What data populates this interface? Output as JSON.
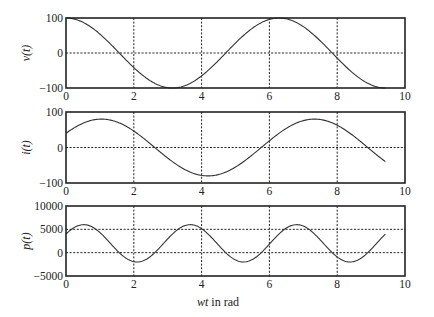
{
  "chart_data": [
    {
      "type": "line",
      "title": "",
      "xlabel": "",
      "ylabel": "v(t)",
      "xlim": [
        0,
        10
      ],
      "ylim": [
        -100,
        100
      ],
      "xticks": [
        0,
        2,
        4,
        6,
        8,
        10
      ],
      "yticks": [
        -100,
        0,
        100
      ],
      "ytick_labels": [
        "−100",
        "0",
        "100"
      ],
      "grid": true,
      "formula": "100*cos(t)",
      "series": [
        {
          "name": "v(t)",
          "x": [
            0,
            0.5,
            1.0,
            1.5,
            2.0,
            2.5,
            3.0,
            3.5,
            4.0,
            4.5,
            5.0,
            5.5,
            6.0,
            6.5,
            7.0,
            7.5,
            8.0,
            8.5,
            9.0,
            9.42
          ],
          "y": [
            100,
            88,
            54,
            7,
            -42,
            -80,
            -99,
            -94,
            -65,
            -21,
            28,
            71,
            96,
            98,
            75,
            35,
            -15,
            -60,
            -91,
            -100
          ]
        }
      ]
    },
    {
      "type": "line",
      "title": "",
      "xlabel": "",
      "ylabel": "i(t)",
      "xlim": [
        0,
        10
      ],
      "ylim": [
        -100,
        100
      ],
      "xticks": [
        0,
        2,
        4,
        6,
        8,
        10
      ],
      "yticks": [
        -100,
        0,
        100
      ],
      "ytick_labels": [
        "−100",
        "0",
        "100"
      ],
      "grid": true,
      "formula": "80*cos(t - pi/3)",
      "series": [
        {
          "name": "i(t)",
          "x": [
            0,
            0.5,
            1.0,
            1.5,
            2.0,
            2.5,
            3.0,
            3.5,
            4.0,
            4.5,
            5.0,
            5.5,
            6.0,
            6.5,
            7.0,
            7.5,
            8.0,
            8.5,
            9.0,
            9.42
          ],
          "y": [
            40,
            69,
            80,
            71,
            44,
            6,
            -35,
            -66,
            -80,
            -75,
            -51,
            -14,
            28,
            62,
            79,
            77,
            55,
            19,
            -23,
            -40
          ]
        }
      ]
    },
    {
      "type": "line",
      "title": "",
      "xlabel": "wt in rad",
      "ylabel": "p(t)",
      "xlim": [
        0,
        10
      ],
      "ylim": [
        -5000,
        10000
      ],
      "xticks": [
        0,
        2,
        4,
        6,
        8,
        10
      ],
      "yticks": [
        -5000,
        0,
        5000,
        10000
      ],
      "ytick_labels": [
        "−5000",
        "0",
        "5000",
        "10000"
      ],
      "grid": true,
      "formula": "2000 + 4000*cos(2t - pi/3)",
      "series": [
        {
          "name": "p(t)",
          "x": [
            0,
            0.52,
            1.0,
            1.5,
            2.09,
            2.5,
            3.0,
            3.66,
            4.0,
            4.5,
            5.24,
            5.5,
            6.0,
            6.81,
            7.0,
            7.5,
            8.38,
            8.8,
            9.42
          ],
          "y": [
            4000,
            6000,
            5600,
            2600,
            -2000,
            -900,
            2500,
            6000,
            5100,
            1400,
            -2000,
            -1300,
            3000,
            6000,
            5700,
            3000,
            -2000,
            -700,
            4000
          ]
        }
      ]
    }
  ],
  "figure": {
    "panels": [
      {
        "ylabel_text": "v(t)"
      },
      {
        "ylabel_text": "i(t)"
      },
      {
        "ylabel_text": "p(t)"
      }
    ],
    "xlabel_italic": "wt",
    "xlabel_rest": " in rad",
    "colors": {
      "line": "#333333",
      "frame": "#222222",
      "background": "#ffffff"
    }
  }
}
